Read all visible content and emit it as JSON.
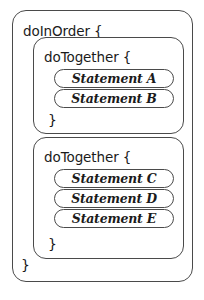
{
  "diagram": {
    "colors": {
      "background": "#ffffff",
      "stroke": "#4a4a4a",
      "text": "#1b1b1b"
    },
    "outer_block": {
      "header": "doInOrder {",
      "closing_brace": "}"
    },
    "groups": [
      {
        "header": "doTogether {",
        "closing_brace": "}",
        "statements": [
          {
            "label": "Statement A"
          },
          {
            "label": "Statement B"
          }
        ]
      },
      {
        "header": "doTogether {",
        "closing_brace": "}",
        "statements": [
          {
            "label": "Statement C"
          },
          {
            "label": "Statement D"
          },
          {
            "label": "Statement E"
          }
        ]
      }
    ]
  }
}
